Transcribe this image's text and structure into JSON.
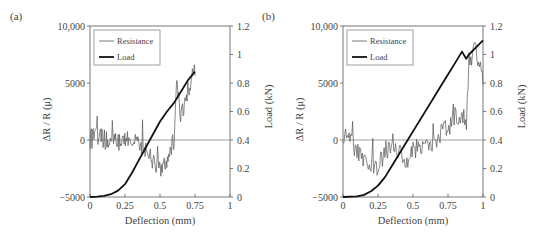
{
  "chart_data": [
    {
      "panel_label": "(a)",
      "type": "line",
      "xlabel": "Deflection (mm)",
      "ylabel_left": "ΔR / R (μ)",
      "ylabel_right": "Load (kN)",
      "xlim": [
        0,
        1
      ],
      "ylim_left": [
        -5000,
        10000
      ],
      "ylim_right": [
        0,
        1.2
      ],
      "x_ticks": [
        "0",
        "0.25",
        "0.5",
        "0.75",
        "1"
      ],
      "y_left_ticks": [
        "10,000",
        "5000",
        "0",
        "−5000"
      ],
      "y_right_ticks": [
        "1.2",
        "1",
        "0.8",
        "0.6",
        "0.4",
        "0.2",
        "0"
      ],
      "legend": [
        "Resistance",
        "Load"
      ],
      "legend_position": "upper-left",
      "series": [
        {
          "name": "Load",
          "axis": "right",
          "x": [
            0,
            0.05,
            0.1,
            0.15,
            0.2,
            0.25,
            0.3,
            0.35,
            0.4,
            0.45,
            0.5,
            0.55,
            0.6,
            0.65,
            0.7,
            0.75
          ],
          "values": [
            0,
            0.002,
            0.008,
            0.02,
            0.045,
            0.09,
            0.17,
            0.26,
            0.35,
            0.44,
            0.53,
            0.6,
            0.66,
            0.74,
            0.82,
            0.88
          ]
        },
        {
          "name": "Resistance",
          "axis": "left",
          "x": [
            0,
            0.05,
            0.1,
            0.15,
            0.2,
            0.25,
            0.3,
            0.35,
            0.4,
            0.45,
            0.5,
            0.55,
            0.6,
            0.62,
            0.65,
            0.7,
            0.75
          ],
          "values": [
            0,
            500,
            0,
            300,
            -200,
            200,
            0,
            -300,
            -1000,
            -2000,
            -2500,
            -1500,
            0,
            4800,
            2000,
            4500,
            6000
          ]
        }
      ]
    },
    {
      "panel_label": "(b)",
      "type": "line",
      "xlabel": "Deflection (mm)",
      "ylabel_left": "ΔR / R (μ)",
      "ylabel_right": "Load (kN)",
      "xlim": [
        0,
        1
      ],
      "ylim_left": [
        -5000,
        10000
      ],
      "ylim_right": [
        0,
        1.2
      ],
      "x_ticks": [
        "0",
        "0.25",
        "0.5",
        "0.75",
        "1"
      ],
      "y_left_ticks": [
        "10,000",
        "5000",
        "0",
        "−5000"
      ],
      "y_right_ticks": [
        "1.2",
        "1",
        "0.8",
        "0.6",
        "0.4",
        "0.2",
        "0"
      ],
      "legend": [
        "Resistance",
        "Load"
      ],
      "legend_position": "upper-left",
      "series": [
        {
          "name": "Load",
          "axis": "right",
          "x": [
            0,
            0.1,
            0.15,
            0.2,
            0.25,
            0.3,
            0.35,
            0.4,
            0.45,
            0.5,
            0.55,
            0.6,
            0.65,
            0.7,
            0.75,
            0.8,
            0.85,
            0.88,
            0.9,
            0.95,
            1.0
          ],
          "values": [
            0,
            0.005,
            0.015,
            0.04,
            0.08,
            0.14,
            0.22,
            0.3,
            0.38,
            0.46,
            0.54,
            0.62,
            0.7,
            0.78,
            0.86,
            0.94,
            1.02,
            0.97,
            1.0,
            1.05,
            1.1
          ]
        },
        {
          "name": "Resistance",
          "axis": "left",
          "x": [
            0,
            0.05,
            0.1,
            0.15,
            0.2,
            0.25,
            0.3,
            0.35,
            0.4,
            0.45,
            0.5,
            0.55,
            0.6,
            0.65,
            0.7,
            0.75,
            0.8,
            0.85,
            0.88,
            0.9,
            0.95,
            1.0
          ],
          "values": [
            500,
            -200,
            -800,
            -1500,
            -2000,
            -2500,
            -1000,
            -500,
            -1000,
            -2000,
            -1000,
            -500,
            0,
            -300,
            500,
            1000,
            2000,
            2500,
            1000,
            7000,
            8000,
            5000
          ]
        }
      ]
    }
  ]
}
